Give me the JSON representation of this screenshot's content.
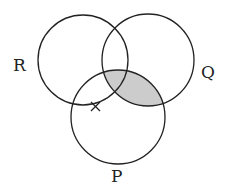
{
  "diagram": {
    "type": "venn",
    "sets": [
      {
        "label": "R",
        "cx": 83,
        "cy": 60,
        "r": 45
      },
      {
        "label": "Q",
        "cx": 148,
        "cy": 60,
        "r": 46
      },
      {
        "label": "P",
        "cx": 118,
        "cy": 117,
        "r": 47
      }
    ],
    "shaded_region": "P ∩ Q",
    "shade_color": "#cccccc",
    "stroke_color": "#222222",
    "marker": "cross",
    "labels": {
      "r": "R",
      "q": "Q",
      "p": "P"
    }
  }
}
